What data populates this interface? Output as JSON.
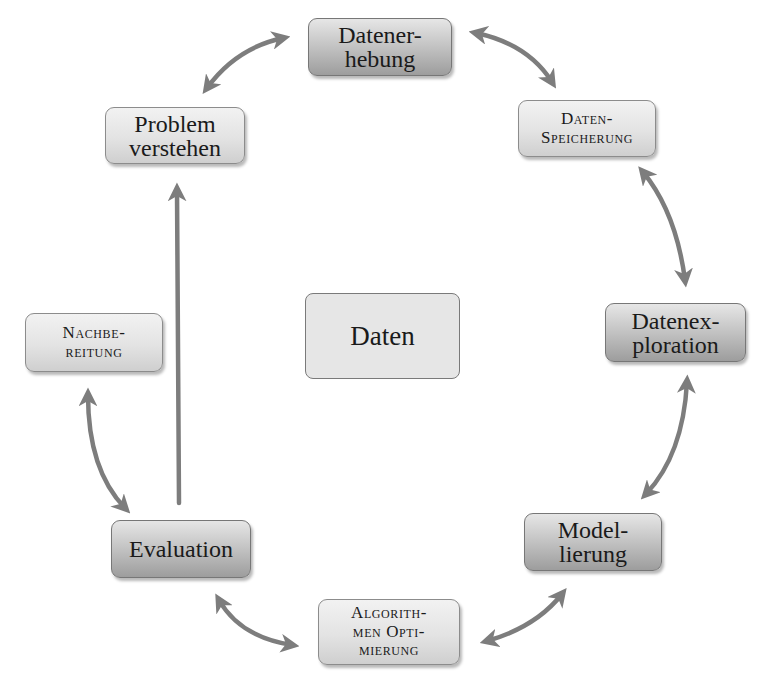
{
  "diagram": {
    "center": {
      "label": "Daten"
    },
    "nodes": [
      {
        "id": "datenerhebung",
        "label": "Datener-\nhebung",
        "style": "dark"
      },
      {
        "id": "datenspeicherung",
        "label": "Daten-\nSpeicherung",
        "style": "light",
        "small_caps": true
      },
      {
        "id": "datenexploration",
        "label": "Datenex-\nploration",
        "style": "dark"
      },
      {
        "id": "modellierung",
        "label": "Model-\nlierung",
        "style": "dark"
      },
      {
        "id": "algorithmen-optimierung",
        "label": "Algorith-\nmen Opti-\nmierung",
        "style": "light",
        "small_caps": true
      },
      {
        "id": "evaluation",
        "label": "Evaluation",
        "style": "dark"
      },
      {
        "id": "nachbereitung",
        "label": "Nachbe-\nreitung",
        "style": "light",
        "small_caps": true
      },
      {
        "id": "problem-verstehen",
        "label": "Problem\nverstehen",
        "style": "light"
      }
    ],
    "edges": [
      {
        "from": "problem-verstehen",
        "to": "datenerhebung",
        "type": "bidirectional-curved"
      },
      {
        "from": "datenerhebung",
        "to": "datenspeicherung",
        "type": "bidirectional-curved"
      },
      {
        "from": "datenspeicherung",
        "to": "datenexploration",
        "type": "bidirectional-curved"
      },
      {
        "from": "datenexploration",
        "to": "modellierung",
        "type": "bidirectional-curved"
      },
      {
        "from": "modellierung",
        "to": "algorithmen-optimierung",
        "type": "bidirectional-curved"
      },
      {
        "from": "algorithmen-optimierung",
        "to": "evaluation",
        "type": "bidirectional-curved"
      },
      {
        "from": "evaluation",
        "to": "nachbereitung",
        "type": "bidirectional-curved"
      },
      {
        "from": "evaluation",
        "to": "problem-verstehen",
        "type": "straight-one-way"
      }
    ],
    "colors": {
      "arrow": "#7d7d7d",
      "box_border": "#8c8c8c",
      "center_fill": "#e6e6e6",
      "background": "#ffffff"
    }
  }
}
